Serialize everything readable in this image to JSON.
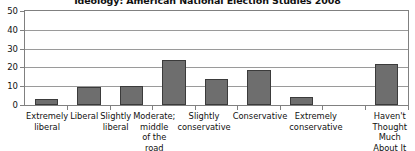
{
  "chart_data": {
    "type": "bar",
    "title": "Ideology: American National Election Studies 2008",
    "xlabel": "",
    "ylabel": "",
    "ylim": [
      0,
      50
    ],
    "yticks": [
      0,
      10,
      20,
      30,
      40,
      50
    ],
    "grid": true,
    "legend": "none",
    "categories": [
      "Extremely liberal",
      "Liberal",
      "Slightly liberal",
      "Moderate; middle of the road",
      "Slightly conservative",
      "Conservative",
      "Extremely conservative",
      "",
      "Haven't Thought Much About It"
    ],
    "category_lines": [
      [
        "Extremely",
        "liberal"
      ],
      [
        "Liberal"
      ],
      [
        "Slightly",
        "liberal"
      ],
      [
        "Moderate;",
        "middle",
        "of the road"
      ],
      [
        "Slightly",
        "conservative"
      ],
      [
        "Conservative"
      ],
      [
        "Extremely",
        "conservative"
      ],
      [
        ""
      ],
      [
        "Haven't",
        "Thought",
        "Much About It"
      ]
    ],
    "values": [
      3,
      9.5,
      10,
      24,
      14,
      18.5,
      4.5,
      null,
      22
    ],
    "bar_color": "#6e6e6e",
    "bar_border_color": "#3b3b3b",
    "gridline_color": "#9a9a9a",
    "axis_color": "#808080"
  }
}
